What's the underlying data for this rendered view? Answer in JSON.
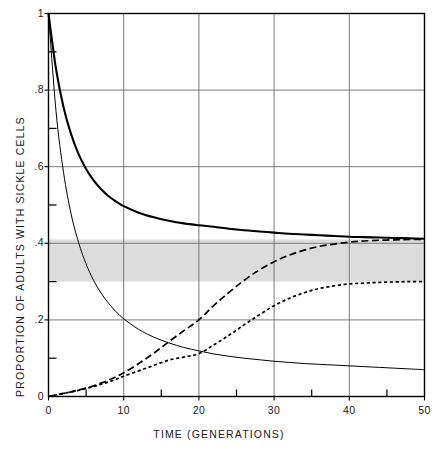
{
  "chart_data": {
    "type": "line",
    "title": "",
    "xlabel": "TIME (GENERATIONS)",
    "ylabel": "PROPORTION OF ADULTS WITH SICKLE CELLS",
    "xlim": [
      0,
      50
    ],
    "ylim": [
      0,
      1
    ],
    "grid": true,
    "legend": "none",
    "x_ticks": [
      0,
      10,
      20,
      30,
      40,
      50
    ],
    "x_tick_labels": [
      "0",
      "10",
      "20",
      "30",
      "40",
      "50"
    ],
    "x_minor_ticks": [
      5,
      15,
      25,
      35,
      45
    ],
    "y_ticks": [
      0,
      0.2,
      0.4,
      0.6,
      0.8,
      1
    ],
    "y_tick_labels": [
      "0",
      ".2",
      ".4",
      ".6",
      ".8",
      "1"
    ],
    "y_minor_ticks": [
      0.1,
      0.3,
      0.5,
      0.7,
      0.9
    ],
    "shaded_band": {
      "label": "equilibrium band",
      "y_min": 0.3,
      "y_max": 0.41,
      "color": "#dcdcdc"
    },
    "x": [
      0,
      1,
      2,
      3,
      4,
      5,
      6,
      7,
      8,
      9,
      10,
      12,
      14,
      16,
      18,
      20,
      22,
      24,
      26,
      28,
      30,
      32,
      34,
      36,
      38,
      40,
      42,
      44,
      46,
      48,
      50
    ],
    "series": [
      {
        "name": "decay to high equilibrium",
        "style": "solid-thick",
        "color": "#000000",
        "values": [
          1.0,
          0.855,
          0.755,
          0.685,
          0.633,
          0.594,
          0.564,
          0.541,
          0.523,
          0.509,
          0.497,
          0.48,
          0.468,
          0.459,
          0.452,
          0.447,
          0.443,
          0.438,
          0.434,
          0.431,
          0.428,
          0.425,
          0.423,
          0.421,
          0.419,
          0.417,
          0.416,
          0.415,
          0.414,
          0.413,
          0.412
        ]
      },
      {
        "name": "decay to low equilibrium",
        "style": "solid-thin",
        "color": "#000000",
        "values": [
          1.0,
          0.745,
          0.585,
          0.477,
          0.402,
          0.346,
          0.303,
          0.27,
          0.243,
          0.221,
          0.203,
          0.175,
          0.155,
          0.14,
          0.128,
          0.119,
          0.111,
          0.105,
          0.1,
          0.096,
          0.092,
          0.089,
          0.086,
          0.084,
          0.082,
          0.08,
          0.078,
          0.076,
          0.074,
          0.072,
          0.07
        ]
      },
      {
        "name": "rise to high equilibrium",
        "style": "dashed-long",
        "color": "#000000",
        "values": [
          0.0,
          0.004,
          0.008,
          0.012,
          0.017,
          0.022,
          0.028,
          0.035,
          0.043,
          0.052,
          0.062,
          0.086,
          0.113,
          0.143,
          0.172,
          0.2,
          0.238,
          0.272,
          0.303,
          0.33,
          0.352,
          0.369,
          0.382,
          0.392,
          0.398,
          0.403,
          0.406,
          0.408,
          0.409,
          0.41,
          0.41
        ]
      },
      {
        "name": "rise to low equilibrium",
        "style": "dashed-short",
        "color": "#000000",
        "values": [
          0.0,
          0.004,
          0.008,
          0.012,
          0.016,
          0.021,
          0.026,
          0.032,
          0.038,
          0.045,
          0.053,
          0.067,
          0.081,
          0.095,
          0.103,
          0.112,
          0.135,
          0.16,
          0.187,
          0.213,
          0.237,
          0.256,
          0.271,
          0.282,
          0.289,
          0.294,
          0.296,
          0.298,
          0.299,
          0.3,
          0.3
        ]
      }
    ]
  }
}
